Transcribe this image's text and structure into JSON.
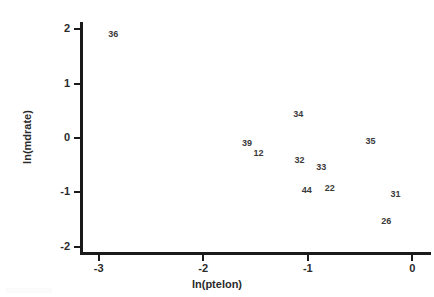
{
  "chart_data": {
    "type": "scatter",
    "title": "",
    "xlabel": "ln(ptelon)",
    "ylabel": "ln(mdrate)",
    "xlim": [
      -3.15,
      0.15
    ],
    "ylim": [
      -2.1,
      2.1
    ],
    "xticks": [
      "-3",
      "-2",
      "-1",
      "0"
    ],
    "xtick_values": [
      -3,
      -2,
      -1,
      0
    ],
    "yticks": [
      "2",
      "1",
      "0",
      "-1",
      "-2"
    ],
    "ytick_values": [
      2,
      1,
      0,
      -1,
      -2
    ],
    "grid": false,
    "legend": "none",
    "marker_style": "text-label",
    "points": [
      {
        "label": "36",
        "x": -2.86,
        "y": 1.92
      },
      {
        "label": "34",
        "x": -1.09,
        "y": 0.45
      },
      {
        "label": "39",
        "x": -1.58,
        "y": -0.09
      },
      {
        "label": "12",
        "x": -1.47,
        "y": -0.28
      },
      {
        "label": "35",
        "x": -0.4,
        "y": -0.05
      },
      {
        "label": "32",
        "x": -1.08,
        "y": -0.4
      },
      {
        "label": "33",
        "x": -0.87,
        "y": -0.53
      },
      {
        "label": "44",
        "x": -1.01,
        "y": -0.96
      },
      {
        "label": "22",
        "x": -0.79,
        "y": -0.92
      },
      {
        "label": "31",
        "x": -0.16,
        "y": -1.03
      },
      {
        "label": "26",
        "x": -0.25,
        "y": -1.53
      }
    ]
  },
  "colors": {
    "axis": "#1a1a1a",
    "text": "#2b2b2b",
    "point": "#3a3a3a",
    "background": "#ffffff"
  }
}
